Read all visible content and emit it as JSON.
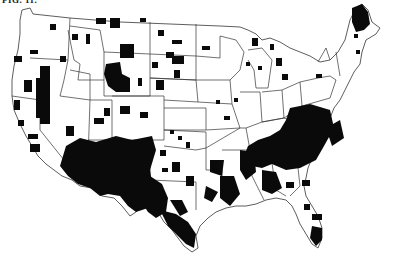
{
  "figure": {
    "caption_visible": "FIG. 11.",
    "caption_note": "caption text clipped at top edge",
    "colors": {
      "shaded": "#0a0a0a",
      "unshaded": "#ffffff",
      "border": "#333333"
    }
  },
  "regions_heavily_shaded": [
    "Arizona",
    "New Mexico",
    "West Texas",
    "South Texas",
    "Southeast (Georgia, Carolinas, Alabama, Mississippi)",
    "Northern Maine",
    "Central Wyoming",
    "Eastern Nevada",
    "South Florida"
  ]
}
